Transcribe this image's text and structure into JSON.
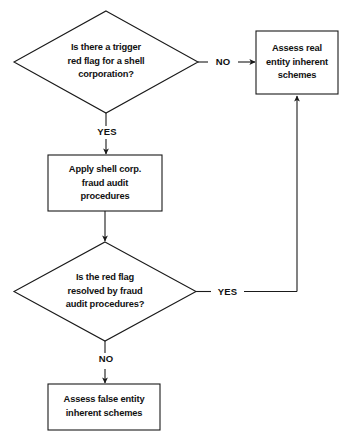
{
  "diagram": {
    "type": "flowchart",
    "background_color": "#ffffff",
    "stroke_color": "#1a1a1a",
    "text_color": "#111111",
    "nodes": [
      {
        "id": "decision-trigger-red-flag",
        "shape": "diamond",
        "text": "Is there a trigger\nred flag for a shell\ncorporation?"
      },
      {
        "id": "process-apply-shell-corp-procedures",
        "shape": "rectangle",
        "text": "Apply shell corp.\nfraud audit\nprocedures"
      },
      {
        "id": "decision-red-flag-resolved",
        "shape": "diamond",
        "text": "Is the red flag\nresolved by fraud\naudit procedures?"
      },
      {
        "id": "terminal-assess-real-entity",
        "shape": "rectangle",
        "text": "Assess real\nentity inherent\nschemes"
      },
      {
        "id": "terminal-assess-false-entity",
        "shape": "rectangle",
        "text": "Assess false entity\ninherent schemes"
      }
    ],
    "edges": [
      {
        "id": "edge-trigger-no",
        "from": "decision-trigger-red-flag",
        "to": "terminal-assess-real-entity",
        "label": "NO"
      },
      {
        "id": "edge-trigger-yes",
        "from": "decision-trigger-red-flag",
        "to": "process-apply-shell-corp-procedures",
        "label": "YES"
      },
      {
        "id": "edge-procedures-to-decision",
        "from": "process-apply-shell-corp-procedures",
        "to": "decision-red-flag-resolved",
        "label": ""
      },
      {
        "id": "edge-resolved-yes",
        "from": "decision-red-flag-resolved",
        "to": "terminal-assess-real-entity",
        "label": "YES"
      },
      {
        "id": "edge-resolved-no",
        "from": "decision-red-flag-resolved",
        "to": "terminal-assess-false-entity",
        "label": "NO"
      }
    ]
  }
}
